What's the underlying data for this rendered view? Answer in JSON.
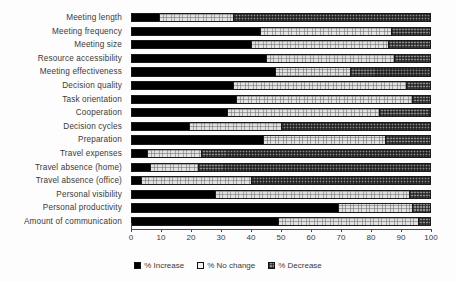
{
  "chart_data": {
    "type": "bar",
    "orientation": "horizontal",
    "stacked": true,
    "stack_total": 100,
    "title": "",
    "subtitle": "",
    "xlabel": "",
    "ylabel": "",
    "xlim": [
      0,
      100
    ],
    "xticks": [
      0,
      10,
      20,
      30,
      40,
      50,
      60,
      70,
      80,
      90,
      100
    ],
    "xtick_labels": [
      "0",
      "10",
      "20",
      "30",
      "40",
      "50",
      "60",
      "70",
      "80",
      "90",
      "100"
    ],
    "grid": false,
    "legend_position": "bottom-center",
    "categories": [
      "Meeting length",
      "Meeting frequency",
      "Meeting size",
      "Resource accessibility",
      "Meeting effectiveness",
      "Decision quality",
      "Task orientation",
      "Cooperation",
      "Decision cycles",
      "Preparation",
      "Travel expenses",
      "Travel absence (home)",
      "Travel absence (office)",
      "Personal visibility",
      "Personal productivity",
      "Amount of communication"
    ],
    "series": [
      {
        "name": "% Increase",
        "color": "#000000",
        "pattern": "solid-black",
        "values": [
          9,
          43,
          40,
          45,
          48,
          34,
          35,
          32,
          19,
          44,
          5,
          6,
          3,
          28,
          69,
          49
        ]
      },
      {
        "name": "% No change",
        "color": "#e2e2e2",
        "pattern": "fine-dot-light",
        "values": [
          25,
          44,
          46,
          43,
          25,
          58,
          59,
          51,
          31,
          41,
          18,
          16,
          37,
          65,
          25,
          47
        ]
      },
      {
        "name": "% Decrease",
        "color": "#8c8c8c",
        "pattern": "dense-hatch-gray",
        "values": [
          66,
          13,
          14,
          12,
          27,
          8,
          6,
          17,
          50,
          15,
          77,
          78,
          60,
          7,
          6,
          4
        ]
      }
    ]
  },
  "legend": {
    "items": [
      {
        "label": "% Increase",
        "swatch": "swatch-increase"
      },
      {
        "label": "% No change",
        "swatch": "swatch-nochange"
      },
      {
        "label": "% Decrease",
        "swatch": "swatch-decrease"
      }
    ]
  }
}
